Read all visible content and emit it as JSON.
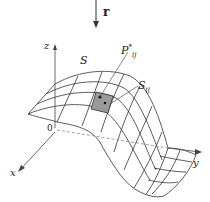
{
  "diagram": {
    "labels": {
      "vector": "r",
      "surface": "S",
      "point_base": "P",
      "point_sup": "*",
      "point_sub": "ij",
      "patch_base": "S",
      "patch_sub": "ij",
      "origin": "0",
      "x_axis": "x",
      "y_axis": "y",
      "z_axis": "z"
    },
    "colors": {
      "line": "#333333",
      "patch_fill": "#9a9a9a",
      "axis": "#444444",
      "background": "#ffffff"
    }
  }
}
